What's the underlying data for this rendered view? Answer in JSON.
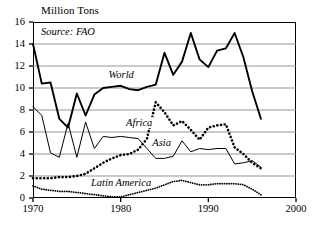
{
  "chart_data": {
    "type": "line",
    "title": "Million Tons",
    "subtitle": "Source: FAO",
    "xlabel": "",
    "ylabel": "Million Tons",
    "xlim": [
      1970,
      2000
    ],
    "ylim": [
      0,
      16
    ],
    "xticks": [
      1970,
      1980,
      1990,
      2000
    ],
    "yticks": [
      0,
      2,
      4,
      6,
      8,
      10,
      12,
      14,
      16
    ],
    "grid": "horizontal",
    "legend": "inline-annotations",
    "annotations": [
      {
        "text": "Source: FAO",
        "x": 1971,
        "y": 15.2,
        "style": "italic"
      },
      {
        "text": "World",
        "x": 1978.5,
        "y": 11.2,
        "style": "italic"
      },
      {
        "text": "Africa",
        "x": 1980.5,
        "y": 6.8,
        "style": "italic"
      },
      {
        "text": "Asia",
        "x": 1983.5,
        "y": 5.0,
        "style": "italic"
      },
      {
        "text": "Latin America",
        "x": 1976.5,
        "y": 1.4,
        "style": "italic"
      }
    ],
    "series": [
      {
        "name": "World",
        "style": "solid-thick",
        "color": "#000000",
        "x": [
          1970,
          1971,
          1972,
          1973,
          1974,
          1975,
          1976,
          1977,
          1978,
          1979,
          1980,
          1981,
          1982,
          1983,
          1984,
          1985,
          1986,
          1987,
          1988,
          1989,
          1990,
          1991,
          1992,
          1993,
          1994,
          1995,
          1996
        ],
        "values": [
          14.0,
          10.4,
          10.5,
          7.2,
          6.4,
          9.5,
          7.5,
          9.4,
          10.0,
          10.1,
          10.2,
          9.9,
          9.8,
          10.1,
          10.3,
          13.2,
          11.2,
          12.4,
          15.0,
          12.6,
          11.9,
          13.4,
          13.6,
          15.0,
          12.8,
          9.7,
          7.2
        ]
      },
      {
        "name": "Africa",
        "style": "dotted-thick",
        "color": "#000000",
        "x": [
          1970,
          1971,
          1972,
          1973,
          1974,
          1975,
          1976,
          1977,
          1978,
          1979,
          1980,
          1981,
          1982,
          1983,
          1984,
          1985,
          1986,
          1987,
          1988,
          1989,
          1990,
          1991,
          1992,
          1993,
          1994,
          1995,
          1996
        ],
        "values": [
          1.8,
          1.8,
          1.8,
          1.9,
          1.9,
          2.0,
          2.2,
          2.7,
          3.2,
          3.6,
          3.9,
          4.0,
          4.4,
          5.4,
          8.7,
          7.8,
          6.6,
          7.0,
          6.2,
          5.3,
          6.4,
          6.6,
          6.7,
          4.6,
          4.0,
          3.2,
          2.7
        ]
      },
      {
        "name": "Asia",
        "style": "solid-thin",
        "color": "#000000",
        "x": [
          1970,
          1971,
          1972,
          1973,
          1974,
          1975,
          1976,
          1977,
          1978,
          1979,
          1980,
          1981,
          1982,
          1983,
          1984,
          1985,
          1986,
          1987,
          1988,
          1989,
          1990,
          1991,
          1992,
          1993,
          1994,
          1995,
          1996
        ],
        "values": [
          8.3,
          7.5,
          4.1,
          3.7,
          6.8,
          3.7,
          6.9,
          4.5,
          5.6,
          5.5,
          5.6,
          5.5,
          5.4,
          4.5,
          3.6,
          3.6,
          3.8,
          5.2,
          4.2,
          4.5,
          4.4,
          4.5,
          4.5,
          3.1,
          3.2,
          3.4,
          2.8
        ]
      },
      {
        "name": "Latin America",
        "style": "dotted-fine",
        "color": "#000000",
        "x": [
          1970,
          1971,
          1972,
          1973,
          1974,
          1975,
          1976,
          1977,
          1978,
          1979,
          1980,
          1981,
          1982,
          1983,
          1984,
          1985,
          1986,
          1987,
          1988,
          1989,
          1990,
          1991,
          1992,
          1993,
          1994,
          1995,
          1996
        ],
        "values": [
          1.1,
          0.8,
          0.7,
          0.6,
          0.6,
          0.5,
          0.4,
          0.3,
          0.2,
          0.1,
          0.1,
          0.3,
          0.5,
          0.7,
          0.9,
          1.2,
          1.5,
          1.6,
          1.4,
          1.2,
          1.2,
          1.3,
          1.3,
          1.3,
          1.2,
          0.8,
          0.3
        ]
      }
    ]
  },
  "axis": {
    "y_labels": [
      "16",
      "14",
      "12",
      "10",
      "8",
      "6",
      "4",
      "2",
      "0"
    ],
    "x_labels": [
      "1970",
      "1980",
      "1990",
      "2000"
    ]
  }
}
